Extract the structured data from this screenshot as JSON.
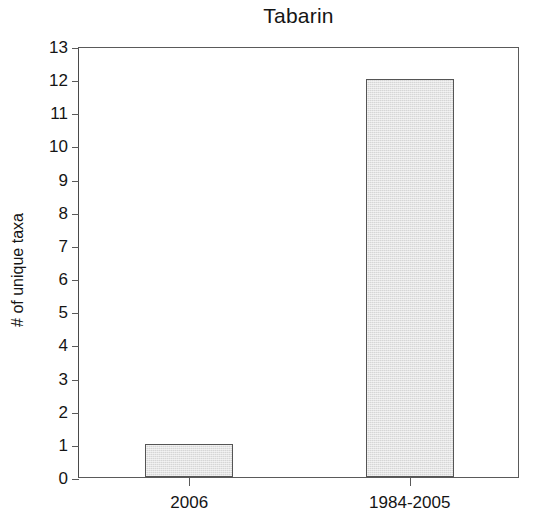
{
  "chart_data": {
    "type": "bar",
    "title": "Tabarin",
    "xlabel": "",
    "ylabel": "# of unique taxa",
    "categories": [
      "2006",
      "1984-2005"
    ],
    "values": [
      1,
      12
    ],
    "series": [
      {
        "name": "# of unique taxa",
        "values": [
          1,
          12
        ]
      }
    ],
    "ylim": [
      0,
      13
    ],
    "ytick_labels": [
      "13",
      "12",
      "11",
      "10",
      "9",
      "8",
      "7",
      "6",
      "5",
      "4",
      "3",
      "2",
      "1",
      "0"
    ],
    "ytick_values": [
      13,
      12,
      11,
      10,
      9,
      8,
      7,
      6,
      5,
      4,
      3,
      2,
      1,
      0
    ],
    "grid": false,
    "legend": false,
    "legend_position": "none",
    "bar_fill_color": "#d6d6d6",
    "bar_edge_color": "#555555",
    "axis_color": "#5a5a5a",
    "background_color": "#ffffff"
  }
}
